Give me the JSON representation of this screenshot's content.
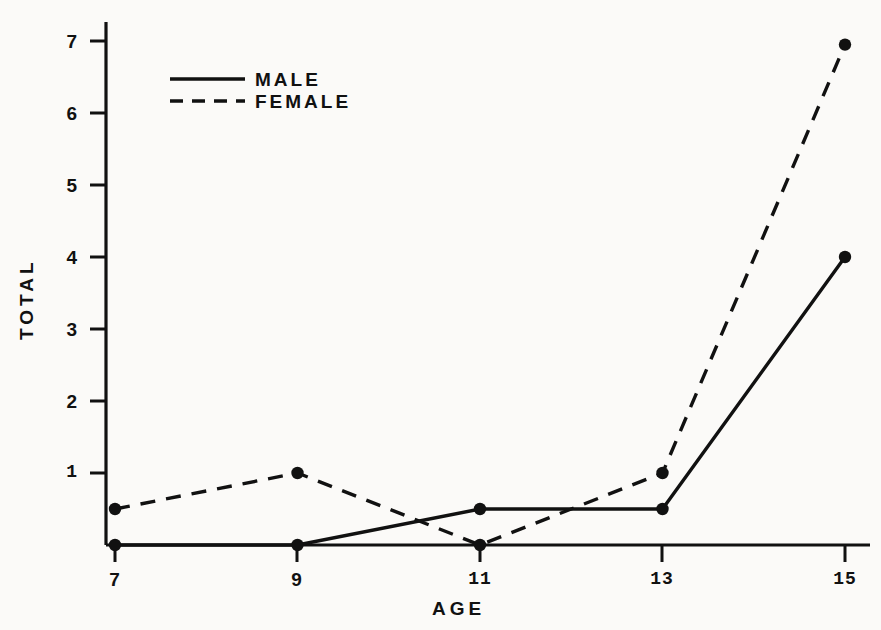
{
  "chart_data": {
    "type": "line",
    "title": "",
    "subtitle": "",
    "xlabel": "AGE",
    "ylabel": "TOTAL",
    "x": [
      7,
      9,
      11,
      13,
      15
    ],
    "xticklabels": [
      "7",
      "9",
      "11",
      "13",
      "15"
    ],
    "yticks": [
      1,
      2,
      3,
      4,
      5,
      6,
      7
    ],
    "yticklabels": [
      "1",
      "2",
      "3",
      "4",
      "5",
      "6",
      "7"
    ],
    "xlim": [
      6.5,
      15.6
    ],
    "ylim": [
      0,
      7.45
    ],
    "grid": false,
    "legend_position": "upper-left-inside",
    "series": [
      {
        "name": "MALE",
        "linestyle": "solid",
        "marker": "circle",
        "color": "#111111",
        "values": [
          0,
          0,
          0.5,
          0.5,
          4.0
        ]
      },
      {
        "name": "FEMALE",
        "linestyle": "dashed",
        "marker": "circle",
        "color": "#111111",
        "values": [
          0.5,
          1.0,
          0,
          1.0,
          6.95
        ]
      }
    ]
  },
  "legend": {
    "entries": [
      {
        "label": "MALE"
      },
      {
        "label": "FEMALE"
      }
    ]
  },
  "axes": {
    "x_title": "AGE",
    "y_title": "TOTAL",
    "y_tick_1": "1",
    "y_tick_2": "2",
    "y_tick_3": "3",
    "y_tick_4": "4",
    "y_tick_5": "5",
    "y_tick_6": "6",
    "y_tick_7": "7",
    "x_tick_7": "7",
    "x_tick_9": "9",
    "x_tick_11": "11",
    "x_tick_13": "13",
    "x_tick_15": "15"
  },
  "colors": {
    "ink": "#111111",
    "background": "#fbfaf8"
  }
}
